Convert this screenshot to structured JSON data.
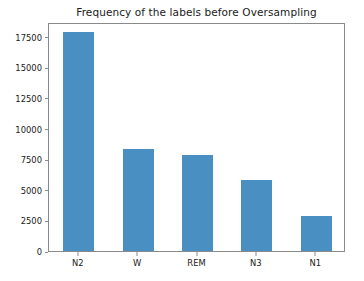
{
  "chart_data": {
    "type": "bar",
    "title": "Frequency of the labels before Oversampling",
    "xlabel": "",
    "ylabel": "",
    "categories": [
      "N2",
      "W",
      "REM",
      "N3",
      "N1"
    ],
    "values": [
      17900,
      8350,
      7800,
      5800,
      2900
    ],
    "series": [
      {
        "name": "Frequency",
        "values": [
          17900,
          8350,
          7800,
          5800,
          2900
        ]
      }
    ],
    "ylim": [
      0,
      18700
    ],
    "ytick_labels": [
      "0",
      "2500",
      "5000",
      "7500",
      "10000",
      "12500",
      "15000",
      "17500"
    ],
    "ytick_values": [
      0,
      2500,
      5000,
      7500,
      10000,
      12500,
      15000,
      17500
    ],
    "xtick_labels": [
      "N2",
      "W",
      "REM",
      "N3",
      "N1"
    ],
    "grid": false,
    "legend": false,
    "bar_color": "#4a8fc2",
    "axis_color": "#8a8a8a",
    "text_color": "#1a1a1a",
    "background_color": "#ffffff"
  }
}
